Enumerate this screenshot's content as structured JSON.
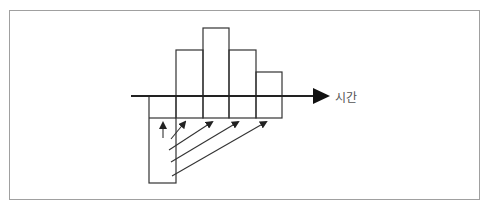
{
  "diagram": {
    "axis_label": "시간",
    "stroke_color": "#333333",
    "frame_color": "#a0a0a0",
    "upper_bars": [
      {
        "x": 176,
        "top": 50
      },
      {
        "x": 203,
        "top": 28
      },
      {
        "x": 229,
        "top": 50
      },
      {
        "x": 256,
        "top": 72
      }
    ],
    "lower_cells": [
      {
        "x": 149,
        "bottom": 183
      },
      {
        "x": 176,
        "bottom": 118
      },
      {
        "x": 203,
        "bottom": 118
      },
      {
        "x": 229,
        "bottom": 118
      },
      {
        "x": 256,
        "bottom": 118
      }
    ],
    "arrows": [
      {
        "x1": 163,
        "y1": 138,
        "x2": 163,
        "y2": 121
      },
      {
        "x1": 171,
        "y1": 139,
        "x2": 186,
        "y2": 121
      },
      {
        "x1": 169,
        "y1": 150,
        "x2": 214,
        "y2": 121
      },
      {
        "x1": 171,
        "y1": 162,
        "x2": 240,
        "y2": 121
      },
      {
        "x1": 172,
        "y1": 176,
        "x2": 268,
        "y2": 121
      }
    ]
  }
}
